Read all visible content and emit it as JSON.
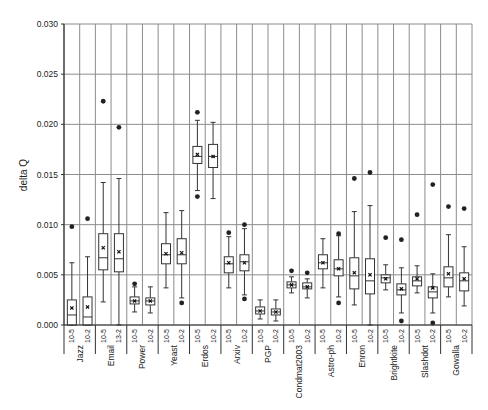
{
  "chart_data": {
    "type": "box",
    "title": "",
    "xlabel": "",
    "ylabel": "delta Q",
    "ylim": [
      0,
      0.03
    ],
    "yticks": [
      "0.000",
      "0.005",
      "0.010",
      "0.015",
      "0.020",
      "0.025",
      "0.030"
    ],
    "ytick_values": [
      0,
      0.005,
      0.01,
      0.015,
      0.02,
      0.025,
      0.03
    ],
    "grid": true,
    "legend": null,
    "groups": [
      {
        "name": "Jazz",
        "boxes": [
          {
            "label": "10-5",
            "whisker_low": 0.0,
            "q1": 0.0,
            "median": 0.001,
            "mean": 0.0017,
            "q3": 0.0025,
            "whisker_high": 0.0062,
            "outliers": [
              0.0098
            ]
          },
          {
            "label": "10-2",
            "whisker_low": 0.0,
            "q1": 0.0,
            "median": 0.0008,
            "mean": 0.0018,
            "q3": 0.0028,
            "whisker_high": 0.0068,
            "outliers": [
              0.0106
            ]
          }
        ]
      },
      {
        "name": "Email",
        "boxes": [
          {
            "label": "10-5",
            "whisker_low": 0.0023,
            "q1": 0.0055,
            "median": 0.0067,
            "mean": 0.0077,
            "q3": 0.0091,
            "whisker_high": 0.0142,
            "outliers": [
              0.0223
            ]
          },
          {
            "label": "13-2",
            "whisker_low": 0.0,
            "q1": 0.0053,
            "median": 0.0066,
            "mean": 0.0073,
            "q3": 0.0091,
            "whisker_high": 0.0146,
            "outliers": [
              0.0197
            ]
          }
        ]
      },
      {
        "name": "Power",
        "boxes": [
          {
            "label": "10-5",
            "whisker_low": 0.0013,
            "q1": 0.0021,
            "median": 0.0024,
            "mean": 0.0024,
            "q3": 0.0028,
            "whisker_high": 0.0038,
            "outliers": [
              0.0041
            ]
          },
          {
            "label": "10-2",
            "whisker_low": 0.0012,
            "q1": 0.002,
            "median": 0.0024,
            "mean": 0.0024,
            "q3": 0.0027,
            "whisker_high": 0.0038,
            "outliers": []
          }
        ]
      },
      {
        "name": "Yeast",
        "boxes": [
          {
            "label": "10-5",
            "whisker_low": 0.0037,
            "q1": 0.0061,
            "median": 0.007,
            "mean": 0.0071,
            "q3": 0.0081,
            "whisker_high": 0.0112,
            "outliers": []
          },
          {
            "label": "10-2",
            "whisker_low": 0.0027,
            "q1": 0.0061,
            "median": 0.007,
            "mean": 0.0072,
            "q3": 0.0086,
            "whisker_high": 0.0114,
            "outliers": [
              0.0022
            ]
          }
        ]
      },
      {
        "name": "Erdos",
        "boxes": [
          {
            "label": "10-5",
            "whisker_low": 0.0134,
            "q1": 0.0161,
            "median": 0.0168,
            "mean": 0.017,
            "q3": 0.0178,
            "whisker_high": 0.0204,
            "outliers": [
              0.0212,
              0.0128
            ]
          },
          {
            "label": "10-2",
            "whisker_low": 0.0126,
            "q1": 0.0157,
            "median": 0.0168,
            "mean": 0.0168,
            "q3": 0.018,
            "whisker_high": 0.0202,
            "outliers": []
          }
        ]
      },
      {
        "name": "Arxiv",
        "boxes": [
          {
            "label": "10-5",
            "whisker_low": 0.0037,
            "q1": 0.0052,
            "median": 0.0061,
            "mean": 0.0062,
            "q3": 0.0068,
            "whisker_high": 0.0088,
            "outliers": [
              0.0092
            ]
          },
          {
            "label": "10-2",
            "whisker_low": 0.003,
            "q1": 0.0054,
            "median": 0.0063,
            "mean": 0.0062,
            "q3": 0.007,
            "whisker_high": 0.0096,
            "outliers": [
              0.01,
              0.0026
            ]
          }
        ]
      },
      {
        "name": "PGP",
        "boxes": [
          {
            "label": "10-5",
            "whisker_low": 0.0006,
            "q1": 0.0011,
            "median": 0.0014,
            "mean": 0.0014,
            "q3": 0.0018,
            "whisker_high": 0.0025,
            "outliers": []
          },
          {
            "label": "10-2",
            "whisker_low": 0.0004,
            "q1": 0.001,
            "median": 0.0013,
            "mean": 0.0013,
            "q3": 0.0016,
            "whisker_high": 0.0025,
            "outliers": []
          }
        ]
      },
      {
        "name": "Condmat2003",
        "boxes": [
          {
            "label": "10-5",
            "whisker_low": 0.0032,
            "q1": 0.0037,
            "median": 0.004,
            "mean": 0.004,
            "q3": 0.0043,
            "whisker_high": 0.0048,
            "outliers": [
              0.0054
            ]
          },
          {
            "label": "10-2",
            "whisker_low": 0.0027,
            "q1": 0.0036,
            "median": 0.0038,
            "mean": 0.0038,
            "q3": 0.0042,
            "whisker_high": 0.0046,
            "outliers": [
              0.0052
            ]
          }
        ]
      },
      {
        "name": "Astro-ph",
        "boxes": [
          {
            "label": "10-5",
            "whisker_low": 0.0037,
            "q1": 0.0056,
            "median": 0.0062,
            "mean": 0.0062,
            "q3": 0.007,
            "whisker_high": 0.0086,
            "outliers": []
          },
          {
            "label": "10-2",
            "whisker_low": 0.0028,
            "q1": 0.0049,
            "median": 0.0056,
            "mean": 0.0056,
            "q3": 0.0065,
            "whisker_high": 0.0089,
            "outliers": [
              0.0091,
              0.0022
            ]
          }
        ]
      },
      {
        "name": "Enron",
        "boxes": [
          {
            "label": "10-5",
            "whisker_low": 0.002,
            "q1": 0.0036,
            "median": 0.0049,
            "mean": 0.0052,
            "q3": 0.0067,
            "whisker_high": 0.0113,
            "outliers": [
              0.0146
            ]
          },
          {
            "label": "10-2",
            "whisker_low": 0.0,
            "q1": 0.0031,
            "median": 0.0044,
            "mean": 0.005,
            "q3": 0.0066,
            "whisker_high": 0.0119,
            "outliers": [
              0.0152
            ]
          }
        ]
      },
      {
        "name": "Brightkite",
        "boxes": [
          {
            "label": "10-5",
            "whisker_low": 0.0035,
            "q1": 0.0042,
            "median": 0.0047,
            "mean": 0.0046,
            "q3": 0.005,
            "whisker_high": 0.006,
            "outliers": [
              0.0087
            ]
          },
          {
            "label": "10-2",
            "whisker_low": 0.0012,
            "q1": 0.003,
            "median": 0.0035,
            "mean": 0.0036,
            "q3": 0.0041,
            "whisker_high": 0.0057,
            "outliers": [
              0.0085,
              0.0004
            ]
          }
        ]
      },
      {
        "name": "Slashdot",
        "boxes": [
          {
            "label": "10-5",
            "whisker_low": 0.0032,
            "q1": 0.0039,
            "median": 0.0044,
            "mean": 0.0046,
            "q3": 0.0048,
            "whisker_high": 0.0059,
            "outliers": [
              0.011
            ]
          },
          {
            "label": "10-2",
            "whisker_low": 0.0012,
            "q1": 0.0027,
            "median": 0.0033,
            "mean": 0.0037,
            "q3": 0.0038,
            "whisker_high": 0.0051,
            "outliers": [
              0.014,
              0.0002
            ]
          }
        ]
      },
      {
        "name": "Gowalla",
        "boxes": [
          {
            "label": "10-5",
            "whisker_low": 0.0028,
            "q1": 0.0038,
            "median": 0.0047,
            "mean": 0.0051,
            "q3": 0.0058,
            "whisker_high": 0.009,
            "outliers": [
              0.0118
            ]
          },
          {
            "label": "10-2",
            "whisker_low": 0.0019,
            "q1": 0.0034,
            "median": 0.0044,
            "mean": 0.0046,
            "q3": 0.0052,
            "whisker_high": 0.0078,
            "outliers": [
              0.0116
            ]
          }
        ]
      }
    ]
  },
  "layout": {
    "plot_left": 64,
    "plot_right": 472,
    "plot_top": 24,
    "plot_bottom": 325,
    "colors": {
      "grid": "#8c8c8c",
      "box_stroke": "#333333",
      "outlier": "#222222",
      "axis": "#333333"
    }
  }
}
